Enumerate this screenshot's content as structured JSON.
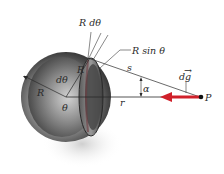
{
  "figure": {
    "colors": {
      "field_vector": "#d0202a",
      "lines": "#3a3a3a",
      "sphere_dark": "#3c3c3c",
      "sphere_light": "#e6e6e6",
      "shadow": "#d9d9d9"
    },
    "labels": {
      "ring_width": "R dθ",
      "ring_radius": "R sin θ",
      "distance_s": "s",
      "field_element": "dg",
      "field_element_arrow": "→",
      "angle_alpha": "α",
      "point": "P",
      "radius": "R",
      "angle_dtheta": "dθ",
      "angle_theta": "θ",
      "distance_r": "r",
      "ring_R": "R"
    }
  }
}
